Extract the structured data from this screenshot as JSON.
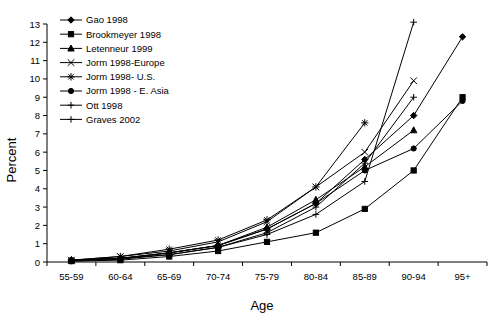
{
  "chart_data": {
    "type": "line",
    "title": "",
    "xlabel": "Age",
    "ylabel": "Percent",
    "categories": [
      "55-59",
      "60-64",
      "65-69",
      "70-74",
      "75-79",
      "80-84",
      "85-89",
      "90-94",
      "95+"
    ],
    "ylim": [
      0,
      13
    ],
    "ytick_labels": [
      "0",
      "1",
      "2",
      "3",
      "4",
      "5",
      "6",
      "7",
      "8",
      "9",
      "10",
      "11",
      "12",
      "13"
    ],
    "grid": false,
    "legend_position": "top-left-inside",
    "series": [
      {
        "name": "Gao 1998",
        "marker": "diamond",
        "values": [
          0.1,
          0.2,
          0.5,
          0.9,
          1.8,
          3.2,
          5.6,
          8.0,
          12.3
        ]
      },
      {
        "name": "Brookmeyer 1998",
        "marker": "square",
        "values": [
          0.05,
          0.1,
          0.3,
          0.6,
          1.1,
          1.6,
          2.9,
          5.0,
          9.0
        ]
      },
      {
        "name": "Letenneur 1999",
        "marker": "triangle",
        "values": [
          0.1,
          0.2,
          0.5,
          0.9,
          1.9,
          3.4,
          5.2,
          7.2,
          null
        ]
      },
      {
        "name": "Jorm 1998-Europe",
        "marker": "cross-x",
        "values": [
          0.1,
          0.3,
          0.6,
          1.1,
          2.2,
          4.1,
          6.0,
          9.9,
          null
        ]
      },
      {
        "name": "Jorm 1998- U.S.",
        "marker": "asterisk",
        "values": [
          0.1,
          0.3,
          0.7,
          1.2,
          2.3,
          4.1,
          7.6,
          null,
          null
        ]
      },
      {
        "name": "Jorm 1998 - E. Asia",
        "marker": "circle",
        "values": [
          0.1,
          0.2,
          0.5,
          0.9,
          1.8,
          3.2,
          5.0,
          6.2,
          8.8
        ]
      },
      {
        "name": "Ott 1998",
        "marker": "plus",
        "values": [
          0.1,
          0.2,
          0.4,
          0.8,
          1.6,
          3.0,
          5.4,
          9.0,
          null
        ]
      },
      {
        "name": "Graves 2002",
        "marker": "plus",
        "values": [
          0.05,
          0.15,
          0.4,
          0.8,
          1.5,
          2.6,
          4.4,
          13.1,
          null
        ]
      }
    ]
  },
  "legend": {
    "items": [
      {
        "label": "Gao 1998"
      },
      {
        "label": "Brookmeyer 1998"
      },
      {
        "label": "Letenneur 1999"
      },
      {
        "label": "Jorm 1998-Europe"
      },
      {
        "label": "Jorm 1998- U.S."
      },
      {
        "label": "Jorm 1998 - E. Asia"
      },
      {
        "label": "Ott 1998"
      },
      {
        "label": "Graves 2002"
      }
    ]
  },
  "colors": {
    "ink": "#000000",
    "background": "#ffffff"
  }
}
